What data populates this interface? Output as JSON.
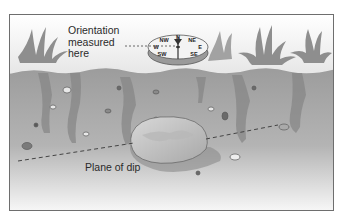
{
  "diagram": {
    "labels": {
      "orientation_line1": "Orientation",
      "orientation_line2": "measured",
      "orientation_line3": "here",
      "plane_of_dip": "Plane of dip"
    },
    "compass": {
      "north": "N",
      "northwest": "NW",
      "northeast": "NE",
      "west": "W",
      "east": "E",
      "southwest": "SW",
      "southeast": "SE"
    },
    "colors": {
      "sky": "#f4f4f4",
      "soil": "#9a9a9a",
      "soil_dark": "#7d7d7d",
      "grass": "#8c8c8c",
      "rock": "#cfcfcf",
      "frame": "#6e6e6e"
    }
  }
}
